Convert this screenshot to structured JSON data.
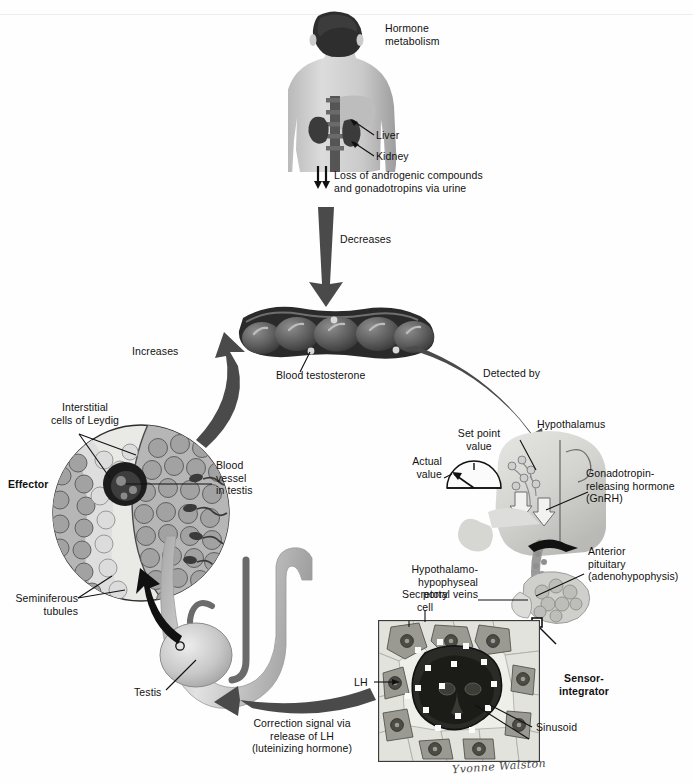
{
  "figure": {
    "signature": "Yvonne Walston"
  },
  "labels": {
    "hormone_metabolism": "Hormone\nmetabolism",
    "liver": "Liver",
    "kidney": "Kidney",
    "loss_of_androgens": "Loss of androgenic compounds\nand gonadotropins via urine",
    "decreases": "Decreases",
    "blood_testosterone": "Blood testosterone",
    "detected_by": "Detected by",
    "increases": "Increases",
    "interstitial_cells": "Interstitial\ncells of Leydig",
    "effector": "Effector",
    "blood_vessel_in_testis": "Blood\nvessel\nin testis",
    "seminiferous_tubules": "Seminiferous\ntubules",
    "testis": "Testis",
    "correction_signal": "Correction signal via\nrelease of LH\n(luteinizing hormone)",
    "set_point_value": "Set point\nvalue",
    "actual_value": "Actual\nvalue",
    "hypothalamus": "Hypothalamus",
    "gnrh": "Gonadotropin-\nreleasing hormone\n(GnRH)",
    "portal_veins": "Hypothalamo-\nhypophyseal\nportal veins",
    "anterior_pituitary": "Anterior\npituitary\n(adenohypophysis)",
    "secretory_cell": "Secretory\ncell",
    "lh": "LH",
    "sensor_integrator": "Sensor-\nintegrator",
    "sinusoid": "Sinusoid"
  },
  "colors": {
    "arrow_dark": "#4a4a4a",
    "arrow_black": "#111111",
    "ink": "#111111",
    "skin": "#c9c9c9",
    "organ_dark": "#3a3a3a",
    "panel_bg": "#f3f2ee",
    "background": "#fefefe"
  },
  "icons": {
    "down_arrow_decreases": "thick-down-arrow-icon",
    "curved_arrow_detected_by": "curved-arrow-icon",
    "curved_arrow_increases": "curved-arrow-icon",
    "curved_arrow_correction": "curved-arrow-icon",
    "small_double_arrow": "double-down-arrow-icon",
    "gauge": "semicircular-gauge-icon"
  }
}
